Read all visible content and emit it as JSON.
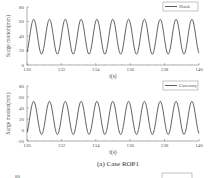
{
  "caption": "(a) Case ROP1",
  "chart_data": [
    {
      "type": "line",
      "title": "",
      "xlabel": "t(s)",
      "ylabel": "Surge motion(mm)",
      "xlim": [
        130,
        140
      ],
      "ylim": [
        0,
        80
      ],
      "xticks": [
        130,
        132,
        134,
        136,
        138,
        140
      ],
      "yticks": [
        0,
        20,
        40,
        60,
        80
      ],
      "legend": {
        "position": "upper right",
        "entries": [
          "Slack"
        ]
      },
      "series": [
        {
          "name": "Slack",
          "mean": 39,
          "amplitude": 24,
          "period_s": 0.92,
          "min": 15,
          "max": 63
        }
      ]
    },
    {
      "type": "line",
      "title": "",
      "xlabel": "t(s)",
      "ylabel": "Surge motion(mm)",
      "xlim": [
        130,
        140
      ],
      "ylim": [
        -20,
        80
      ],
      "xticks": [
        130,
        132,
        134,
        136,
        138,
        140
      ],
      "yticks": [
        -20,
        0,
        20,
        40,
        60,
        80
      ],
      "legend": {
        "position": "upper right",
        "entries": [
          "Catenary"
        ]
      },
      "series": [
        {
          "name": "Catenary",
          "mean": 22,
          "amplitude": 30,
          "period_s": 0.92,
          "min": -8,
          "max": 53
        }
      ]
    }
  ],
  "next_legend": "Slack",
  "next_ytick": "80"
}
